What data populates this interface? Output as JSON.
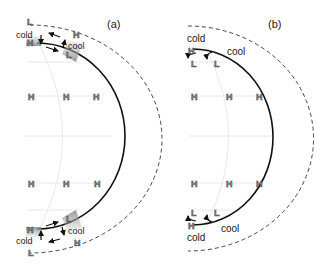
{
  "panels": [
    {
      "id": "a",
      "label": "(a)",
      "hemisphere_labels": {
        "north_corner_low": "L",
        "north_cold": "cold",
        "north_cold_high": "H",
        "north_cool_high": "H",
        "north_cool": "cool",
        "north_cool_low": "L",
        "south_cool_low": "L",
        "south_cold_high": "H",
        "south_cold": "cold",
        "south_cool": "cool",
        "south_cool_high": "H",
        "south_corner_low": "L"
      },
      "row_markers_top": [
        "H",
        "H",
        "H"
      ],
      "row_markers_bottom": [
        "H",
        "H",
        "H"
      ]
    },
    {
      "id": "b",
      "label": "(b)",
      "hemisphere_labels": {
        "north_cold": "cold",
        "north_high": "H",
        "north_cool": "cool",
        "north_low_1": "L",
        "north_low_2": "L",
        "south_low_1": "L",
        "south_low_2": "L",
        "south_high": "H",
        "south_cold": "cold",
        "south_cool": "cool"
      },
      "row_markers_top": [
        "H",
        "H",
        "H"
      ],
      "row_markers_bottom": [
        "H",
        "H",
        "H"
      ]
    }
  ],
  "colors": {
    "solid_curve": "#111111",
    "dashed_curve": "#444444",
    "faint_lines": "#dddddd",
    "shading": "#9a9a9a",
    "marker_fill": "#888888"
  }
}
